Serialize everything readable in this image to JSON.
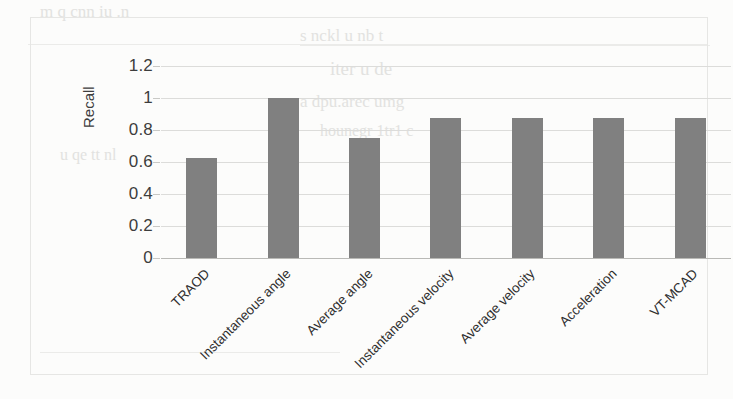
{
  "chart_data": {
    "type": "bar",
    "title": "",
    "xlabel": "",
    "ylabel": "Recall",
    "categories": [
      "TRAOD",
      "Instantaneous angle",
      "Average angle",
      "Instantaneous velocity",
      "Average velocity",
      "Acceleration",
      "VT-MCAD"
    ],
    "values": [
      0.625,
      1.0,
      0.75,
      0.875,
      0.875,
      0.875,
      0.875
    ],
    "ylim": [
      0,
      1.2
    ],
    "yticks": [
      "0",
      "0.2",
      "0.4",
      "0.6",
      "0.8",
      "1",
      "1.2"
    ],
    "ytick_values": [
      0,
      0.2,
      0.4,
      0.6,
      0.8,
      1,
      1.2
    ],
    "grid": true,
    "legend": false,
    "legend_position": "none",
    "bar_color": "#808080",
    "grid_color": "#dcdcda",
    "background_color": "#fcfcfb",
    "text_color": "#2e2e2e"
  },
  "background_bleed": {
    "note": "faint reversed show-through text from scanned page",
    "fragments": [
      "m q cnn iu .n",
      "s  nckl u  nb t",
      "iter u    de",
      "a   dpu.arec  umg",
      "hounegr 1tr1  c",
      "u  qe  tt  nl"
    ]
  }
}
